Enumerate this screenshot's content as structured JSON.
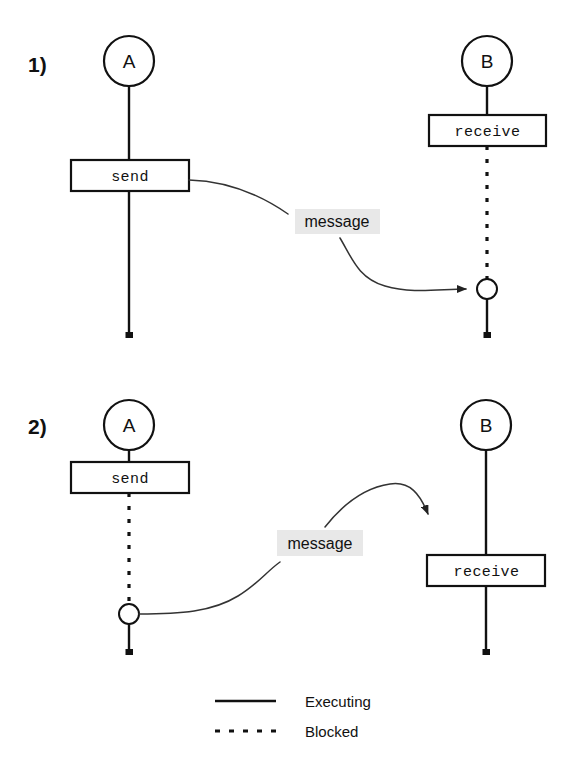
{
  "diagram": {
    "background_color": "#ffffff",
    "ink_color": "#111111",
    "highlight_color": "#e8e8e8"
  },
  "panels": [
    {
      "index_label": "1)",
      "sender": {
        "name": "A",
        "state_label": "send",
        "lifeline_after_state": "Executing"
      },
      "receiver": {
        "name": "B",
        "state_label": "receive",
        "lifeline_after_state": "Blocked"
      },
      "message_label": "message",
      "arrow_direction": "sender-to-receiver"
    },
    {
      "index_label": "2)",
      "sender": {
        "name": "A",
        "state_label": "send",
        "lifeline_after_state": "Blocked"
      },
      "receiver": {
        "name": "B",
        "state_label": "receive",
        "lifeline_after_state": "Executing"
      },
      "message_label": "message",
      "arrow_direction": "sender-to-receiver"
    }
  ],
  "legend": {
    "items": [
      {
        "style": "solid",
        "label": "Executing"
      },
      {
        "style": "dashed",
        "label": "Blocked"
      }
    ]
  }
}
